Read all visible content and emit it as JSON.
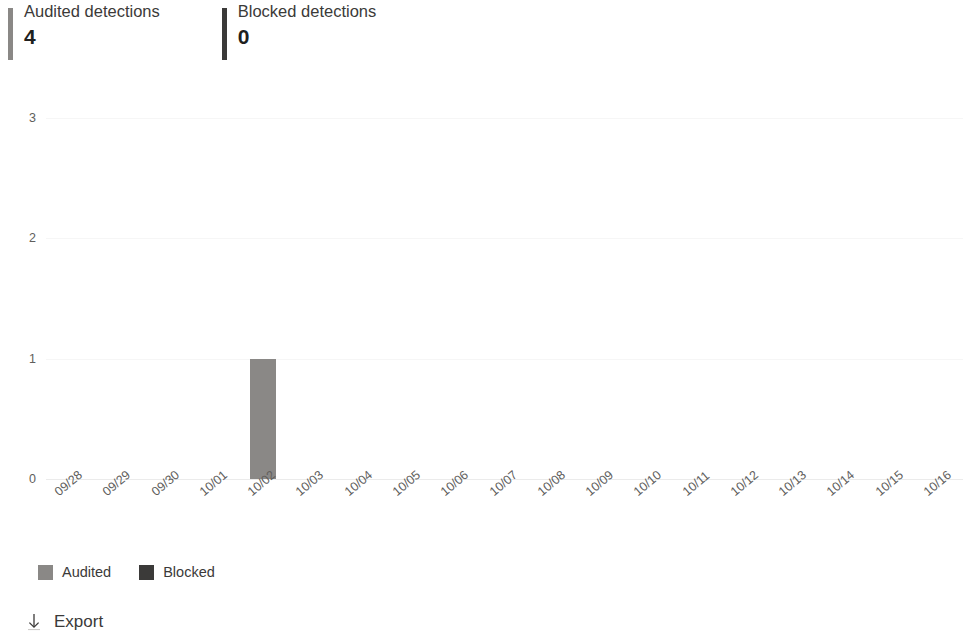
{
  "kpis": [
    {
      "title": "Audited detections",
      "value": "4",
      "accent_color": "#8a8886"
    },
    {
      "title": "Blocked detections",
      "value": "0",
      "accent_color": "#3b3a39"
    }
  ],
  "legend": {
    "items": [
      {
        "label": "Audited",
        "color": "#8a8886"
      },
      {
        "label": "Blocked",
        "color": "#3b3a39"
      }
    ]
  },
  "export": {
    "label": "Export",
    "icon": "download-arrow-icon"
  },
  "chart_data": {
    "type": "bar",
    "title": "",
    "subtitle": "",
    "xlabel": "",
    "ylabel": "",
    "ylim": [
      0,
      3
    ],
    "yticks": [
      0,
      1,
      2,
      3
    ],
    "grid": true,
    "legend_position": "bottom-left",
    "stacked": false,
    "categories": [
      "09/28",
      "09/29",
      "09/30",
      "10/01",
      "10/02",
      "10/03",
      "10/04",
      "10/05",
      "10/06",
      "10/07",
      "10/08",
      "10/09",
      "10/10",
      "10/11",
      "10/12",
      "10/13",
      "10/14",
      "10/15",
      "10/16"
    ],
    "series": [
      {
        "name": "Audited",
        "color": "#8a8886",
        "values": [
          0,
          0,
          0,
          0,
          1,
          0,
          0,
          0,
          0,
          0,
          0,
          0,
          0,
          0,
          0,
          0,
          0,
          0,
          0
        ]
      },
      {
        "name": "Blocked",
        "color": "#3b3a39",
        "values": [
          0,
          0,
          0,
          0,
          0,
          0,
          0,
          0,
          0,
          0,
          0,
          0,
          0,
          0,
          0,
          0,
          0,
          0,
          0
        ]
      }
    ]
  }
}
